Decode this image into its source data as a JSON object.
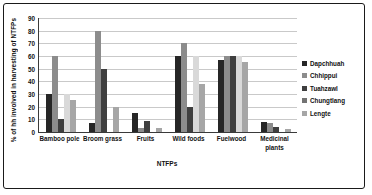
{
  "chart_data": {
    "type": "bar",
    "title": "",
    "xlabel": "NTFPs",
    "ylabel": "% of hh involved in harvesting of NTFPs",
    "ylim": [
      0,
      90
    ],
    "ytick_step": 10,
    "yticks": [
      90,
      80,
      70,
      60,
      50,
      40,
      30,
      20,
      10,
      0
    ],
    "grid": true,
    "legend_position": "right",
    "categories": [
      "Bamboo pole",
      "Broom grass",
      "Fruits",
      "Wild foods",
      "Fuelwood",
      "Medicinal plants"
    ],
    "series": [
      {
        "name": "Dapchhuah",
        "color": "#262626",
        "values": [
          30,
          7,
          15,
          60,
          57,
          8
        ]
      },
      {
        "name": "Chhippui",
        "color": "#8c8c8c",
        "values": [
          60,
          80,
          3,
          70,
          60,
          7
        ]
      },
      {
        "name": "Tuahzawl",
        "color": "#3f3f3f",
        "values": [
          10,
          50,
          9,
          20,
          60,
          4
        ]
      },
      {
        "name": "Chungtlang",
        "color": "#d9d9d9",
        "values": [
          30,
          0,
          0,
          60,
          60,
          0
        ]
      },
      {
        "name": "Lengte",
        "color": "#a6a6a6",
        "values": [
          25,
          20,
          3,
          38,
          55,
          2
        ]
      }
    ]
  },
  "legend": {
    "items": [
      {
        "label": "Dapchhuah",
        "color": "#262626"
      },
      {
        "label": "Chhippui",
        "color": "#8c8c8c"
      },
      {
        "label": "Tuahzawl",
        "color": "#3f3f3f"
      },
      {
        "label": "Chungtlang",
        "color": "#737373"
      },
      {
        "label": "Lengte",
        "color": "#a6a6a6"
      }
    ]
  }
}
